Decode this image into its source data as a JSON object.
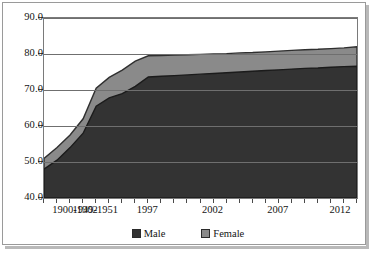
{
  "chart_data": {
    "type": "area",
    "stacked": true,
    "title": "",
    "subtitle": "",
    "xlabel": "",
    "ylabel": "",
    "ylim": [
      40.0,
      90.0
    ],
    "ytick_labels": [
      "90.0",
      "80.0",
      "70.0",
      "60.0",
      "50.0",
      "40.0"
    ],
    "ytick_values": [
      90.0,
      80.0,
      70.0,
      60.0,
      50.0,
      40.0
    ],
    "grid": true,
    "grid_axis": "y",
    "legend_position": "bottom",
    "xtick_labels": [
      "1900-1902",
      "1949-1951",
      "1997",
      "2002",
      "2007",
      "2012"
    ],
    "xtick_label_positions": [
      0,
      4,
      8,
      13,
      18,
      23
    ],
    "x": [
      "1900-1902",
      "1910-1912",
      "1920-1922",
      "1930-1932",
      "1949-1951",
      "1960-1962",
      "1970-1972",
      "1980-1982",
      "1997",
      "1998",
      "1999",
      "2000",
      "2001",
      "2002",
      "2003",
      "2004",
      "2005",
      "2006",
      "2007",
      "2008",
      "2009",
      "2010",
      "2011",
      "2012",
      "2013"
    ],
    "series": [
      {
        "name": "Male",
        "color": "#333333",
        "values": [
          48.0,
          50.5,
          54.0,
          58.0,
          65.5,
          67.8,
          69.0,
          71.0,
          73.6,
          73.8,
          74.0,
          74.2,
          74.4,
          74.6,
          74.8,
          75.0,
          75.2,
          75.4,
          75.6,
          75.8,
          76.0,
          76.1,
          76.3,
          76.5,
          76.6
        ]
      },
      {
        "name": "Female",
        "color": "#8a8a8a",
        "values": [
          51.0,
          54.0,
          57.5,
          62.0,
          70.5,
          73.5,
          75.5,
          78.0,
          79.5,
          79.6,
          79.7,
          79.8,
          79.9,
          80.0,
          80.1,
          80.3,
          80.4,
          80.6,
          80.8,
          81.0,
          81.2,
          81.3,
          81.5,
          81.7,
          82.0
        ]
      }
    ]
  },
  "legend": {
    "items": [
      {
        "label": "Male",
        "color": "#333333"
      },
      {
        "label": "Female",
        "color": "#8a8a8a"
      }
    ]
  }
}
